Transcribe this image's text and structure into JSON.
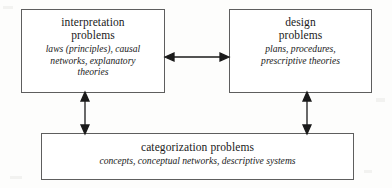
{
  "diagram": {
    "background_color": "#fdfdfc",
    "stroke_color": "#5e5e5e",
    "arrow_color": "#1a1a1a",
    "boxes": [
      {
        "id": "interpretation",
        "title_lines": [
          "interpretation",
          "problems"
        ],
        "subtitle_lines": [
          "laws (principles), causal",
          "networks, explanatory",
          "theories"
        ]
      },
      {
        "id": "design",
        "title_lines": [
          "design",
          "problems"
        ],
        "subtitle_lines": [
          "plans, procedures,",
          "prescriptive theories"
        ]
      },
      {
        "id": "categorization",
        "title_lines": [
          "categorization problems"
        ],
        "subtitle_lines": [
          "concepts, conceptual networks, descriptive systems"
        ]
      }
    ],
    "connectors": [
      {
        "id": "interpretation-design",
        "orientation": "horizontal",
        "style": "double-headed",
        "from": "interpretation",
        "to": "design"
      },
      {
        "id": "interpretation-categorization",
        "orientation": "vertical",
        "style": "double-headed",
        "from": "interpretation",
        "to": "categorization"
      },
      {
        "id": "design-categorization",
        "orientation": "vertical",
        "style": "double-headed",
        "from": "design",
        "to": "categorization"
      }
    ]
  }
}
